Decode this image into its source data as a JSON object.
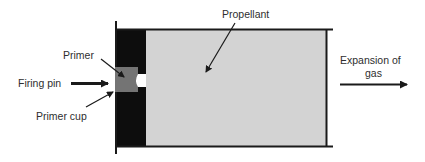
{
  "diagram": {
    "labels": {
      "primer": "Primer",
      "firing_pin": "Firing pin",
      "primer_cup": "Primer cup",
      "propellant": "Propellant",
      "expansion_line1": "Expansion of",
      "expansion_line2": "gas"
    },
    "colors": {
      "case_black": "#0d0d0d",
      "propellant_fill": "#d3d3d3",
      "primer_fill": "#747474",
      "outline": "#1a1a1a",
      "flash_hole": "#ffffff",
      "text": "#2e2e2e"
    },
    "components": [
      {
        "id": "case-head",
        "shape": "rect",
        "description": "solid black base of cartridge"
      },
      {
        "id": "primer",
        "shape": "square",
        "description": "grey primer seated in base"
      },
      {
        "id": "flash-hole",
        "shape": "notch",
        "description": "white opening between primer and propellant"
      },
      {
        "id": "propellant",
        "shape": "rect",
        "description": "grey filled chamber"
      },
      {
        "id": "firing-pin-arrow",
        "direction": "right"
      },
      {
        "id": "gas-arrow",
        "direction": "right"
      }
    ]
  }
}
